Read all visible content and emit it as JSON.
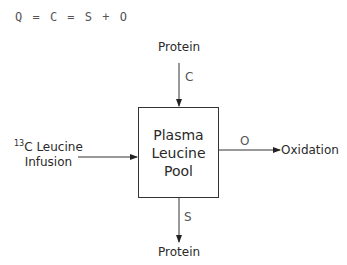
{
  "equation": "Q = C = S + O",
  "diagram": {
    "pool": {
      "line1": "Plasma",
      "line2": "Leucine",
      "line3": "Pool"
    },
    "top_source": "Protein",
    "top_flux": "C",
    "left_source_sup": "13",
    "left_source_line1": "C Leucine",
    "left_source_line2": "Infusion",
    "right_flux": "O",
    "right_sink": "Oxidation",
    "bottom_flux": "S",
    "bottom_sink": "Protein"
  }
}
